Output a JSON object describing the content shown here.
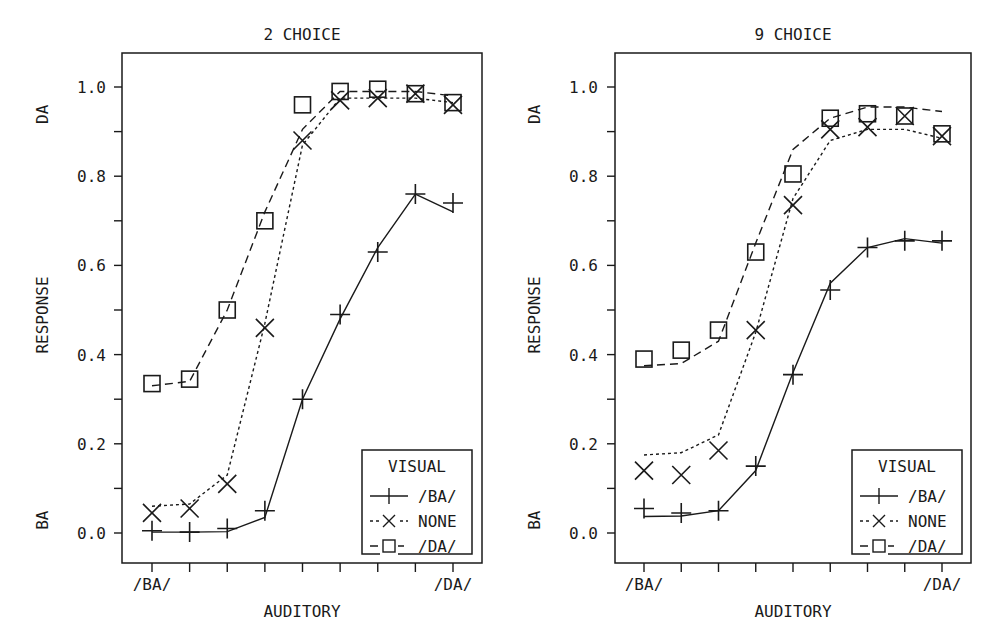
{
  "chart_data": [
    {
      "type": "line",
      "title": "2 CHOICE",
      "xlabel": "AUDITORY",
      "ylabel": "RESPONSE",
      "ylabel_top": "DA",
      "ylabel_bottom": "BA",
      "x": [
        1,
        2,
        3,
        4,
        5,
        6,
        7,
        8,
        9
      ],
      "x_tick_labels": {
        "1": "/BA/",
        "9": "/DA/"
      },
      "y_ticks": [
        "0.0",
        "0.2",
        "0.4",
        "0.6",
        "0.8",
        "1.0"
      ],
      "ylim": [
        -0.07,
        1.07
      ],
      "grid": false,
      "legend": {
        "title": "VISUAL",
        "position": "lower right",
        "entries": [
          "/BA/",
          "NONE",
          "/DA/"
        ]
      },
      "series": [
        {
          "name": "/BA/",
          "marker": "plus",
          "line": "solid",
          "values": [
            0.005,
            0.002,
            0.01,
            0.05,
            0.3,
            0.49,
            0.63,
            0.76,
            0.74
          ],
          "fit": [
            0.002,
            0.002,
            0.003,
            0.035,
            0.3,
            0.48,
            0.64,
            0.76,
            0.72
          ]
        },
        {
          "name": "NONE",
          "marker": "x",
          "line": "dotted",
          "values": [
            0.045,
            0.055,
            0.11,
            0.46,
            0.88,
            0.97,
            0.975,
            0.985,
            0.96
          ],
          "fit": [
            0.06,
            0.065,
            0.13,
            0.47,
            0.87,
            0.975,
            0.975,
            0.975,
            0.965
          ]
        },
        {
          "name": "/DA/",
          "marker": "square",
          "line": "dashed",
          "values": [
            0.335,
            0.345,
            0.5,
            0.7,
            0.96,
            0.99,
            0.995,
            0.985,
            0.965
          ],
          "fit": [
            0.33,
            0.34,
            0.5,
            0.72,
            0.905,
            0.99,
            0.99,
            0.99,
            0.98
          ]
        }
      ]
    },
    {
      "type": "line",
      "title": "9 CHOICE",
      "xlabel": "AUDITORY",
      "ylabel": "RESPONSE",
      "ylabel_top": "DA",
      "ylabel_bottom": "BA",
      "x": [
        1,
        2,
        3,
        4,
        5,
        6,
        7,
        8,
        9
      ],
      "x_tick_labels": {
        "1": "/BA/",
        "9": "/DA/"
      },
      "y_ticks": [
        "0.0",
        "0.2",
        "0.4",
        "0.6",
        "0.8",
        "1.0"
      ],
      "ylim": [
        -0.07,
        1.07
      ],
      "grid": false,
      "legend": {
        "title": "VISUAL",
        "position": "lower right",
        "entries": [
          "/BA/",
          "NONE",
          "/DA/"
        ]
      },
      "series": [
        {
          "name": "/BA/",
          "marker": "plus",
          "line": "solid",
          "values": [
            0.055,
            0.045,
            0.05,
            0.15,
            0.355,
            0.545,
            0.64,
            0.655,
            0.655
          ],
          "fit": [
            0.037,
            0.038,
            0.05,
            0.14,
            0.36,
            0.56,
            0.64,
            0.66,
            0.65
          ]
        },
        {
          "name": "NONE",
          "marker": "x",
          "line": "dotted",
          "values": [
            0.14,
            0.13,
            0.185,
            0.455,
            0.735,
            0.905,
            0.91,
            0.935,
            0.89
          ],
          "fit": [
            0.175,
            0.18,
            0.22,
            0.45,
            0.75,
            0.88,
            0.905,
            0.905,
            0.885
          ]
        },
        {
          "name": "/DA/",
          "marker": "square",
          "line": "dashed",
          "values": [
            0.39,
            0.41,
            0.455,
            0.63,
            0.805,
            0.93,
            0.94,
            0.935,
            0.895
          ],
          "fit": [
            0.375,
            0.38,
            0.43,
            0.65,
            0.86,
            0.93,
            0.955,
            0.955,
            0.945
          ]
        }
      ]
    }
  ],
  "panels": [
    {
      "title": "2 CHOICE",
      "xlabel": "AUDITORY",
      "ylabel": "RESPONSE",
      "ytop": "DA",
      "ybot": "BA",
      "xfirst": "/BA/",
      "xlast": "/DA/",
      "legend_title": "VISUAL",
      "legend": [
        "/BA/",
        "NONE",
        "/DA/"
      ],
      "yticks": [
        "0.0",
        "0.2",
        "0.4",
        "0.6",
        "0.8",
        "1.0"
      ]
    },
    {
      "title": "9 CHOICE",
      "xlabel": "AUDITORY",
      "ylabel": "RESPONSE",
      "ytop": "DA",
      "ybot": "BA",
      "xfirst": "/BA/",
      "xlast": "/DA/",
      "legend_title": "VISUAL",
      "legend": [
        "/BA/",
        "NONE",
        "/DA/"
      ],
      "yticks": [
        "0.0",
        "0.2",
        "0.4",
        "0.6",
        "0.8",
        "1.0"
      ]
    }
  ]
}
